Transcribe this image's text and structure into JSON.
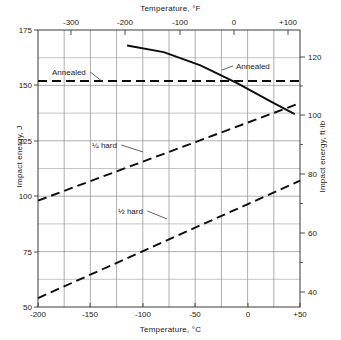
{
  "chart_data": {
    "type": "line",
    "title": "",
    "xlabel": "Temperature, °C",
    "ylabel": "Impact energy, J",
    "xlabel_top": "Temperature, °F",
    "ylabel_right": "Impact energy, ft·lb",
    "grid": true,
    "legend_position": "inline-annotations",
    "xlim": [
      -200,
      50
    ],
    "ylim": [
      50,
      175
    ],
    "xlim_top_F": [
      -328,
      122
    ],
    "ylim_right_ftlb": [
      36.9,
      129.1
    ],
    "x_ticks": [
      -200,
      -150,
      -100,
      -50,
      0,
      50
    ],
    "x_tick_labels": [
      "-200",
      "-150",
      "-100",
      "-50",
      "0",
      "+50"
    ],
    "x_minor_step": 25,
    "y_ticks": [
      50,
      75,
      100,
      125,
      150,
      175
    ],
    "y_tick_labels": [
      "50",
      "75",
      "100",
      "125",
      "150",
      "175"
    ],
    "y_minor_step": 12.5,
    "x_top_ticks_F": [
      -300,
      -200,
      -100,
      0,
      100
    ],
    "x_top_tick_labels": [
      "-300",
      "-200",
      "-100",
      "0",
      "+100"
    ],
    "y_right_ticks_ftlb": [
      40,
      60,
      80,
      100,
      120
    ],
    "y_right_tick_labels": [
      "40",
      "60",
      "80",
      "100",
      "120"
    ],
    "series": [
      {
        "name": "Annealed (flat)",
        "label": "Annealed",
        "style": "dashed",
        "points": [
          [
            -200,
            152
          ],
          [
            50,
            152
          ]
        ]
      },
      {
        "name": "Annealed (descending)",
        "label": "Annealed",
        "style": "solid",
        "points": [
          [
            -115,
            168
          ],
          [
            -80,
            165
          ],
          [
            -45,
            159
          ],
          [
            -10,
            151
          ],
          [
            25,
            142
          ],
          [
            45,
            137
          ]
        ]
      },
      {
        "name": "Quarter hard",
        "label": "¼ hard",
        "style": "dashed",
        "points": [
          [
            -200,
            98
          ],
          [
            50,
            142
          ]
        ]
      },
      {
        "name": "Half hard",
        "label": "½ hard",
        "style": "dashed",
        "points": [
          [
            -200,
            54
          ],
          [
            50,
            107
          ]
        ]
      }
    ],
    "annotations": [
      {
        "text": "Annealed",
        "x_px": 52,
        "y_px": 68,
        "leader_to_x": 103,
        "leader_to_y": 82
      },
      {
        "text": "Annealed",
        "x_px": 236,
        "y_px": 62,
        "leader_to_x": 222,
        "leader_to_y": 70
      },
      {
        "text": "¼ hard",
        "x_px": 92,
        "y_px": 141,
        "leader_to_x": 143,
        "leader_to_y": 152
      },
      {
        "text": "½ hard",
        "x_px": 118,
        "y_px": 207,
        "leader_to_x": 167,
        "leader_to_y": 219
      }
    ]
  },
  "axes": {
    "top_title": "Temperature, °F",
    "bottom_title": "Temperature, °C",
    "left_title": "Impact energy, J",
    "right_title": "Impact energy, ft·lb"
  },
  "ticks": {
    "top": [
      {
        "label": "-300",
        "x": 71
      },
      {
        "label": "-200",
        "x": 125
      },
      {
        "label": "-100",
        "x": 180
      },
      {
        "label": "0",
        "x": 234
      },
      {
        "label": "+100",
        "x": 288
      }
    ],
    "bottom": [
      {
        "label": "-200",
        "x": 38
      },
      {
        "label": "-150",
        "x": 90
      },
      {
        "label": "-100",
        "x": 143
      },
      {
        "label": "-50",
        "x": 195
      },
      {
        "label": "0",
        "x": 248
      },
      {
        "label": "+50",
        "x": 300
      }
    ],
    "left": [
      {
        "label": "175",
        "y": 30
      },
      {
        "label": "150",
        "y": 85
      },
      {
        "label": "125",
        "y": 141
      },
      {
        "label": "100",
        "y": 196
      },
      {
        "label": "75",
        "y": 252
      },
      {
        "label": "50",
        "y": 307
      }
    ],
    "right": [
      {
        "label": "120",
        "y": 57
      },
      {
        "label": "100",
        "y": 115
      },
      {
        "label": "80",
        "y": 174
      },
      {
        "label": "60",
        "y": 233
      },
      {
        "label": "40",
        "y": 292
      }
    ]
  },
  "labels": {
    "annealed_left": "Annealed",
    "annealed_right": "Annealed",
    "quarter_hard": "¼ hard",
    "half_hard": "½ hard"
  }
}
